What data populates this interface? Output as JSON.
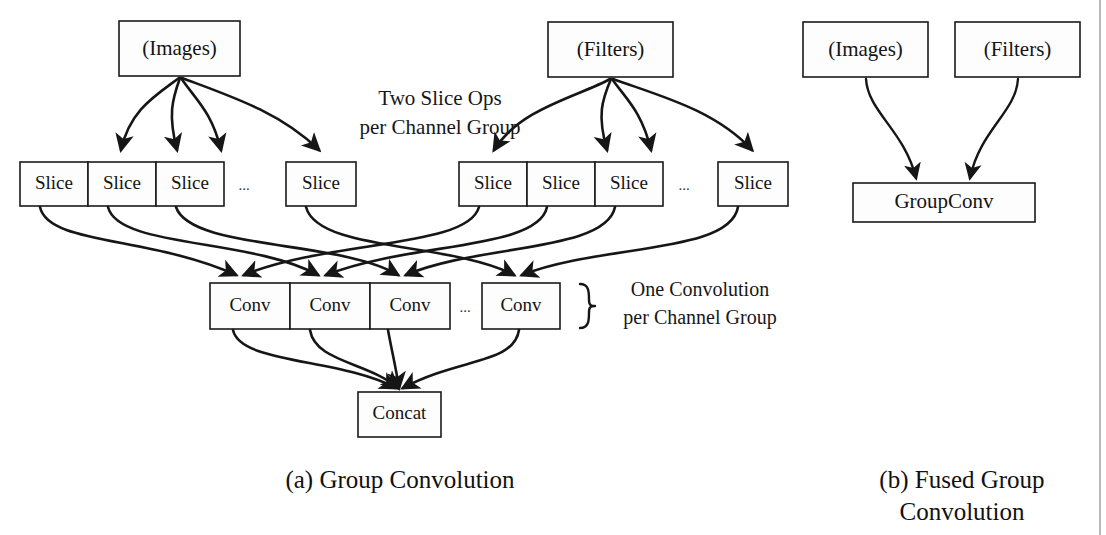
{
  "figure": {
    "background_color": "#ffffff",
    "ink_color": "#161616",
    "box_fill": "#fdfdfd",
    "divider_color": "#9a9a9a"
  },
  "panel_a": {
    "caption": "(a) Group Convolution",
    "inputs": [
      {
        "label": "(Images)"
      },
      {
        "label": "(Filters)"
      }
    ],
    "annotation_slice": {
      "line1": "Two Slice Ops",
      "line2": "per Channel Group"
    },
    "annotation_conv": {
      "line1": "One Convolution",
      "line2": "per Channel Group"
    },
    "slice_label": "Slice",
    "conv_label": "Conv",
    "concat_label": "Concat",
    "ellipsis": "...",
    "images_slices": [
      "Slice",
      "Slice",
      "Slice",
      "Slice"
    ],
    "filters_slices": [
      "Slice",
      "Slice",
      "Slice",
      "Slice"
    ],
    "convs": [
      "Conv",
      "Conv",
      "Conv",
      "Conv"
    ],
    "output": "Concat"
  },
  "panel_b": {
    "caption_line1": "(b) Fused Group",
    "caption_line2": "Convolution",
    "inputs": [
      {
        "label": "(Images)"
      },
      {
        "label": "(Filters)"
      }
    ],
    "fused_node": "GroupConv"
  }
}
